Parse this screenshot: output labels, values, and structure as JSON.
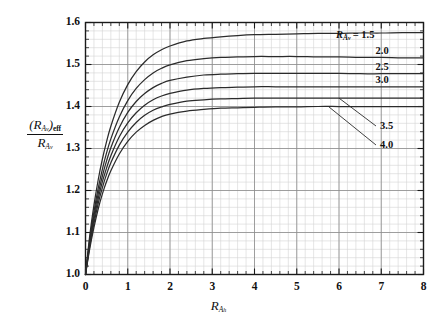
{
  "figure": {
    "background_color": "#ffffff",
    "plot_border_color": "#1a1a1a",
    "major_grid_color": "#8c8c8c",
    "minor_grid_color": "#d4d4d4",
    "curve_color": "#2b2b2b"
  },
  "axes": {
    "y_axis": {
      "title_numerator_R": "R",
      "title_numerator_sub": "A",
      "title_numerator_subsub": "v",
      "title_numerator_eff": "eff",
      "title_denominator_R": "R",
      "title_denominator_sub": "A",
      "title_denominator_subsub": "v",
      "ticks": [
        "1.0",
        "1.1",
        "1.2",
        "1.3",
        "1.4",
        "1.5",
        "1.6"
      ],
      "min": 1.0,
      "max": 1.6,
      "major_step": 0.1,
      "minor_step": 0.02
    },
    "x_axis": {
      "title_R": "R",
      "title_sub": "A",
      "title_subsub": "h",
      "ticks": [
        "0",
        "1",
        "2",
        "3",
        "4",
        "5",
        "6",
        "7",
        "8"
      ],
      "min": 0,
      "max": 8,
      "major_step": 1,
      "minor_step": 0.2
    }
  },
  "legend": {
    "header_R": "R",
    "header_sub": "A",
    "header_subsub": "v",
    "header_equals": "= 1.5",
    "entries": [
      "1.5",
      "2.0",
      "2.5",
      "3.0",
      "3.5",
      "4.0"
    ]
  },
  "chart_data": {
    "type": "line",
    "title": "",
    "xlabel": "R_Ah",
    "ylabel": "(R_Av)_eff / R_Av",
    "xlim": [
      0,
      8
    ],
    "ylim": [
      1.0,
      1.6
    ],
    "grid": true,
    "minor_grid": true,
    "legend_position": "inside-right",
    "x": [
      0,
      0.1,
      0.2,
      0.3,
      0.4,
      0.5,
      0.6,
      0.8,
      1.0,
      1.2,
      1.4,
      1.6,
      1.8,
      2.0,
      2.4,
      2.8,
      3.2,
      3.6,
      4.0,
      4.5,
      5.0,
      5.5,
      6.0,
      6.5,
      7.0,
      7.5,
      8.0
    ],
    "series": [
      {
        "name": "1.5",
        "label": "1.5",
        "values": [
          1.0,
          1.092,
          1.165,
          1.225,
          1.275,
          1.317,
          1.353,
          1.41,
          1.452,
          1.483,
          1.506,
          1.523,
          1.535,
          1.544,
          1.556,
          1.562,
          1.566,
          1.569,
          1.571,
          1.572,
          1.573,
          1.574,
          1.574,
          1.575,
          1.575,
          1.576,
          1.576
        ]
      },
      {
        "name": "2.0",
        "label": "2.0",
        "values": [
          1.0,
          1.083,
          1.15,
          1.205,
          1.251,
          1.29,
          1.323,
          1.375,
          1.414,
          1.443,
          1.464,
          1.48,
          1.491,
          1.499,
          1.509,
          1.514,
          1.517,
          1.518,
          1.519,
          1.519,
          1.519,
          1.518,
          1.518,
          1.517,
          1.517,
          1.516,
          1.516
        ]
      },
      {
        "name": "2.5",
        "label": "2.5",
        "values": [
          1.0,
          1.077,
          1.14,
          1.192,
          1.235,
          1.271,
          1.302,
          1.35,
          1.386,
          1.412,
          1.431,
          1.445,
          1.455,
          1.462,
          1.47,
          1.475,
          1.477,
          1.478,
          1.479,
          1.479,
          1.479,
          1.479,
          1.479,
          1.478,
          1.478,
          1.478,
          1.478
        ]
      },
      {
        "name": "3.0",
        "label": "3.0",
        "values": [
          1.0,
          1.072,
          1.131,
          1.18,
          1.221,
          1.254,
          1.283,
          1.328,
          1.361,
          1.385,
          1.403,
          1.416,
          1.425,
          1.431,
          1.439,
          1.443,
          1.445,
          1.446,
          1.447,
          1.447,
          1.447,
          1.447,
          1.447,
          1.447,
          1.447,
          1.447,
          1.447
        ]
      },
      {
        "name": "3.5",
        "label": "3.5",
        "values": [
          1.0,
          1.067,
          1.122,
          1.169,
          1.207,
          1.239,
          1.266,
          1.308,
          1.339,
          1.362,
          1.379,
          1.391,
          1.399,
          1.405,
          1.413,
          1.416,
          1.418,
          1.419,
          1.42,
          1.42,
          1.42,
          1.42,
          1.42,
          1.42,
          1.42,
          1.42,
          1.42
        ]
      },
      {
        "name": "4.0",
        "label": "4.0",
        "values": [
          1.0,
          1.061,
          1.112,
          1.156,
          1.192,
          1.222,
          1.247,
          1.287,
          1.317,
          1.339,
          1.355,
          1.367,
          1.376,
          1.382,
          1.389,
          1.393,
          1.396,
          1.397,
          1.398,
          1.399,
          1.399,
          1.4,
          1.4,
          1.4,
          1.4,
          1.4,
          1.4
        ]
      }
    ],
    "annotations": [
      {
        "text": "1.5",
        "type": "inline-label",
        "at_x": 8.0
      },
      {
        "text": "2.0",
        "type": "inline-label",
        "at_x": 8.0
      },
      {
        "text": "2.5",
        "type": "inline-label",
        "at_x": 8.0
      },
      {
        "text": "3.0",
        "type": "inline-label",
        "at_x": 8.0
      },
      {
        "text": "3.5",
        "type": "leader-line-label",
        "at_x": 6.0
      },
      {
        "text": "4.0",
        "type": "leader-line-label",
        "at_x": 5.8
      }
    ]
  }
}
